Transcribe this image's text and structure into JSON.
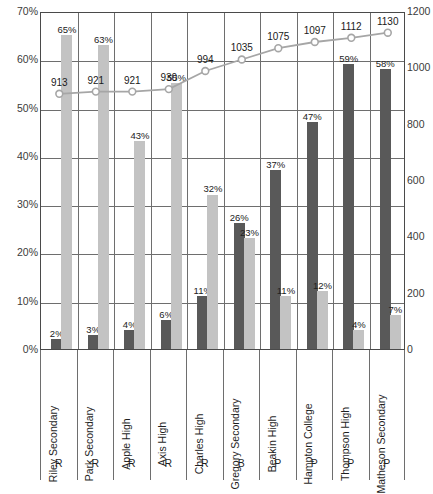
{
  "chart_data": {
    "type": "bar",
    "title": "",
    "subtitle": "",
    "xlabel": "",
    "ylabel": "",
    "grid": true,
    "legend": "none",
    "categories": [
      "Riley Secondary",
      "Park Secondary",
      "Apple High",
      "Axis High",
      "Charles High",
      "Gregory Secondary",
      "Beakin High",
      "Hampton College",
      "Thompson High",
      "Matheson Secondary"
    ],
    "category_codes": [
      "R",
      "R",
      "R",
      "R",
      "R",
      "B",
      "P",
      "P",
      "P",
      "P"
    ],
    "left_axis": {
      "ylim": [
        0,
        70
      ],
      "ticks": [
        "0%",
        "10%",
        "20%",
        "30%",
        "40%",
        "50%",
        "60%",
        "70%"
      ],
      "tick_values": [
        0,
        10,
        20,
        30,
        40,
        50,
        60,
        70
      ],
      "unit": "%"
    },
    "right_axis": {
      "ylim": [
        0,
        1200
      ],
      "ticks": [
        "0",
        "200",
        "400",
        "600",
        "800",
        "1000",
        "1200"
      ],
      "tick_values": [
        0,
        200,
        400,
        600,
        800,
        1000,
        1200
      ]
    },
    "series": [
      {
        "name": "dark-bar-series",
        "render": "bar",
        "axis": "left",
        "color": "#595959",
        "values": [
          2,
          3,
          4,
          6,
          11,
          26,
          37,
          47,
          59,
          58
        ],
        "labels": [
          "2%",
          "3%",
          "4%",
          "6%",
          "11%",
          "26%",
          "37%",
          "47%",
          "59%",
          "58%"
        ]
      },
      {
        "name": "light-bar-series",
        "render": "bar",
        "axis": "left",
        "color": "#c3c3c3",
        "values": [
          65,
          63,
          43,
          55,
          32,
          23,
          11,
          12,
          4,
          7
        ],
        "labels": [
          "65%",
          "63%",
          "43%",
          "55%",
          "32%",
          "23%",
          "11%",
          "12%",
          "4%",
          "7%"
        ]
      },
      {
        "name": "line-series",
        "render": "line",
        "axis": "right",
        "color": "#a6a6a6",
        "marker": "circle-open",
        "values": [
          913,
          921,
          921,
          930,
          994,
          1035,
          1075,
          1097,
          1112,
          1130
        ],
        "labels": [
          "913",
          "921",
          "921",
          "930",
          "994",
          "1035",
          "1075",
          "1097",
          "1112",
          "1130"
        ]
      }
    ]
  }
}
